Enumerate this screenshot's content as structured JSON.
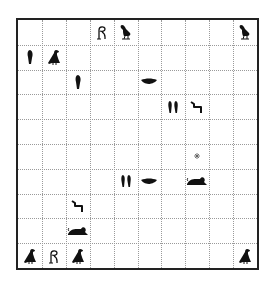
{
  "board": {
    "cols": 10,
    "rows": 10,
    "border_color": "#222222",
    "grid_color": "#9a9a9a",
    "glyph_color": "#111111",
    "pieces": [
      {
        "col": 3,
        "row": 0,
        "glyph": "twisted-flax"
      },
      {
        "col": 4,
        "row": 0,
        "glyph": "quail-chick"
      },
      {
        "col": 9,
        "row": 0,
        "glyph": "quail-chick"
      },
      {
        "col": 0,
        "row": 1,
        "glyph": "reed-leaf"
      },
      {
        "col": 1,
        "row": 1,
        "glyph": "vulture"
      },
      {
        "col": 2,
        "row": 2,
        "glyph": "reed-leaf"
      },
      {
        "col": 5,
        "row": 2,
        "glyph": "mouth"
      },
      {
        "col": 6,
        "row": 3,
        "glyph": "double-reed"
      },
      {
        "col": 7,
        "row": 3,
        "glyph": "step"
      },
      {
        "col": 7,
        "row": 5,
        "glyph": "star-marker"
      },
      {
        "col": 4,
        "row": 6,
        "glyph": "double-reed"
      },
      {
        "col": 5,
        "row": 6,
        "glyph": "mouth"
      },
      {
        "col": 7,
        "row": 6,
        "glyph": "lion"
      },
      {
        "col": 2,
        "row": 7,
        "glyph": "step"
      },
      {
        "col": 2,
        "row": 8,
        "glyph": "lion"
      },
      {
        "col": 0,
        "row": 9,
        "glyph": "vulture"
      },
      {
        "col": 1,
        "row": 9,
        "glyph": "twisted-flax"
      },
      {
        "col": 2,
        "row": 9,
        "glyph": "vulture"
      },
      {
        "col": 9,
        "row": 9,
        "glyph": "vulture"
      }
    ]
  }
}
